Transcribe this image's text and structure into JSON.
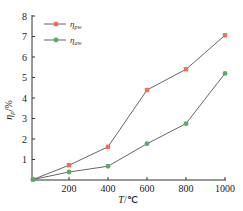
{
  "chart_data": {
    "type": "line",
    "title": "",
    "xlabel": "T/℃",
    "ylabel": "η_p/%",
    "x": [
      0,
      200,
      400,
      600,
      800,
      1000
    ],
    "xticks": [
      "200",
      "400",
      "600",
      "800",
      "1000"
    ],
    "yticks": [
      "1",
      "2",
      "3",
      "4",
      "5",
      "6",
      "7",
      "8"
    ],
    "xlim": [
      0,
      1000
    ],
    "ylim": [
      0,
      8
    ],
    "grid": false,
    "legend_position": "upper-left",
    "series": [
      {
        "name": "η_pw",
        "color": "#e8735a",
        "marker": "square",
        "values": [
          0,
          0.72,
          1.62,
          4.39,
          5.4,
          7.06
        ]
      },
      {
        "name": "η_aw",
        "color": "#5aa86a",
        "marker": "circle",
        "values": [
          0,
          0.39,
          0.67,
          1.77,
          2.75,
          5.2
        ]
      }
    ]
  },
  "labels": {
    "xlabel_main": "T",
    "xlabel_unit": "/℃",
    "ylabel_main": "η",
    "ylabel_sub": "p",
    "ylabel_unit": "/%",
    "legend": [
      {
        "main": "η",
        "sub": "pw"
      },
      {
        "main": "η",
        "sub": "aw"
      }
    ]
  }
}
